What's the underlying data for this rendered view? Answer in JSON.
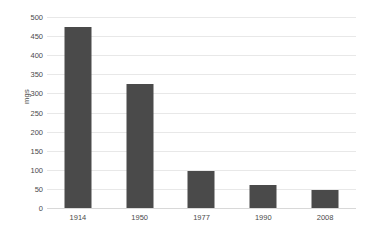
{
  "chart_data": {
    "type": "bar",
    "title": "",
    "xlabel": "",
    "ylabel": "mgs",
    "categories": [
      "1914",
      "1950",
      "1977",
      "1990",
      "2008"
    ],
    "values": [
      475,
      325,
      98,
      60,
      47
    ],
    "ylim": [
      0,
      500
    ],
    "yticks": [
      0,
      50,
      100,
      150,
      200,
      250,
      300,
      350,
      400,
      450,
      500
    ],
    "ytick_labels": [
      "0",
      "50",
      "100",
      "150",
      "200",
      "250",
      "300",
      "350",
      "400",
      "450",
      "500"
    ],
    "grid": true,
    "legend": false,
    "series": [
      {
        "name": "mgs",
        "values": [
          475,
          325,
          98,
          60,
          47
        ],
        "color": "#4a4a4a"
      }
    ],
    "colors": {
      "bar": "#4a4a4a",
      "gridline": "#e8e8e8",
      "baseline": "#d8d8d8",
      "text": "#4a4a4a",
      "background": "#ffffff"
    }
  }
}
